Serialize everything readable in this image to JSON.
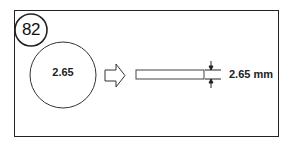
{
  "figure": {
    "number": "82",
    "circle_label": "2.65",
    "dimension_label": "2.65 mm"
  },
  "icons": {
    "badge": "circled-number",
    "arrow": "block-arrow-right",
    "rod": "flat-rod",
    "dimension": "dimension-arrows-vertical"
  },
  "colors": {
    "stroke": "#222222",
    "background": "#ffffff"
  }
}
